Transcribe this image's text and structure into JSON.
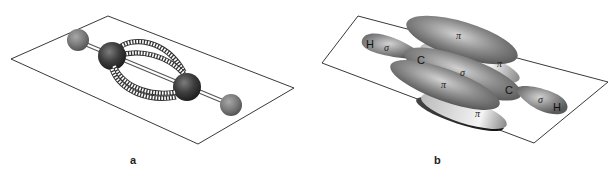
{
  "panels": [
    {
      "id": "a",
      "label": "a",
      "description": "ball-and-stick model with p-orbital overlap lobes"
    },
    {
      "id": "b",
      "label": "b",
      "orbital_labels": {
        "pi": "π",
        "sigma": "σ"
      },
      "atom_labels": {
        "carbon": "C",
        "hydrogen": "H"
      }
    }
  ]
}
